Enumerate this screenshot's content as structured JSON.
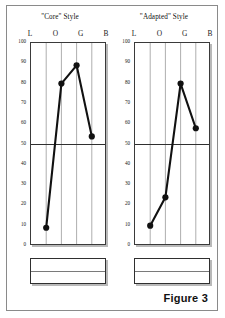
{
  "figure": {
    "caption": "Figure 3",
    "background_color": "#ffffff",
    "border_color": "#8a8a8a"
  },
  "panels": [
    {
      "id": "core",
      "title": "\"Core\" Style",
      "column_headers": [
        "L",
        "O",
        "G",
        "B"
      ],
      "legend_box": {
        "top_text": "",
        "bottom_text": ""
      }
    },
    {
      "id": "adapted",
      "title": "\"Adapted\" Style",
      "column_headers": [
        "L",
        "O",
        "G",
        "B"
      ],
      "legend_box": {
        "top_text": "",
        "bottom_text": ""
      }
    }
  ],
  "axis": {
    "y_ticks": [
      100,
      90,
      80,
      70,
      60,
      50,
      40,
      30,
      20,
      10,
      0
    ],
    "y_min": 0,
    "y_max": 100,
    "midline_value": 50
  },
  "style": {
    "line_color": "#111111",
    "marker_color": "#111111",
    "gridline_color": "#8c8c8c",
    "midline_color": "#2f2f2f",
    "frame_color": "#3a3a3a",
    "shadow_color": "#b9b9b9"
  },
  "chart_data": [
    {
      "type": "line",
      "title": "\"Core\" Style",
      "categories": [
        "L",
        "O",
        "G",
        "B"
      ],
      "values": [
        9,
        80,
        89,
        54
      ],
      "xlabel": "",
      "ylabel": "",
      "ylim": [
        0,
        100
      ],
      "yticks": [
        0,
        10,
        20,
        30,
        40,
        50,
        60,
        70,
        80,
        90,
        100
      ],
      "grid": "vertical-at-each-category",
      "reference_line": 50,
      "markers": "filled-circle",
      "legend": "none"
    },
    {
      "type": "line",
      "title": "\"Adapted\" Style",
      "categories": [
        "L",
        "O",
        "G",
        "B"
      ],
      "values": [
        10,
        24,
        80,
        58
      ],
      "xlabel": "",
      "ylabel": "",
      "ylim": [
        0,
        100
      ],
      "yticks": [
        0,
        10,
        20,
        30,
        40,
        50,
        60,
        70,
        80,
        90,
        100
      ],
      "grid": "vertical-at-each-category",
      "reference_line": 50,
      "markers": "filled-circle",
      "legend": "none"
    }
  ]
}
